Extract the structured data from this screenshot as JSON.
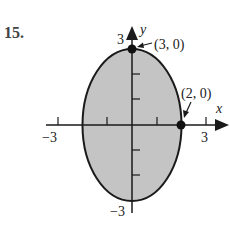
{
  "problem": {
    "number": "15."
  },
  "axes": {
    "x_label": "x",
    "y_label": "y",
    "x_min_label": "−3",
    "x_max_label": "3",
    "y_min_label": "−3",
    "y_max_label": "3"
  },
  "points": [
    {
      "label": "(3, 0)",
      "note": "top vertex annotation"
    },
    {
      "label": "(2, 0)",
      "note": "right vertex annotation"
    }
  ],
  "colors": {
    "fill": "#c4c4c4",
    "stroke": "#1a1a1a",
    "text": "#222222"
  }
}
